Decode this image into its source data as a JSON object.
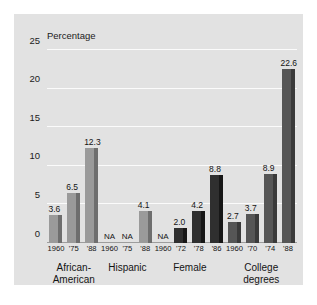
{
  "chart_data": {
    "type": "bar",
    "title": "",
    "xlabel": "",
    "ylabel": "Percentage",
    "ylim": [
      0,
      25
    ],
    "yticks": [
      0,
      5,
      10,
      15,
      20,
      25
    ],
    "ytick_labels": [
      "0",
      "5",
      "10",
      "15",
      "20",
      "25"
    ],
    "grid": true,
    "legend": "none",
    "na_text": "NA",
    "groups": [
      {
        "name": "African-American",
        "label_lines": [
          "African-",
          "American"
        ],
        "color": "#9a9a9a",
        "side_color": "#6e6e6e",
        "bars": [
          {
            "year": "1960",
            "value": 3.6,
            "label": "3.6",
            "na": false
          },
          {
            "year": "'75",
            "value": 6.5,
            "label": "6.5",
            "na": false
          },
          {
            "year": "'88",
            "value": 12.3,
            "label": "12.3",
            "na": false
          }
        ]
      },
      {
        "name": "Hispanic",
        "label_lines": [
          "Hispanic"
        ],
        "color": "#9a9a9a",
        "side_color": "#6e6e6e",
        "bars": [
          {
            "year": "1960",
            "value": null,
            "label": "NA",
            "na": true
          },
          {
            "year": "'75",
            "value": null,
            "label": "NA",
            "na": true
          },
          {
            "year": "'88",
            "value": 4.1,
            "label": "4.1",
            "na": false
          }
        ]
      },
      {
        "name": "Female",
        "label_lines": [
          "Female"
        ],
        "color": "#2f2f2f",
        "side_color": "#171717",
        "bars": [
          {
            "year": "1960",
            "value": null,
            "label": "NA",
            "na": true
          },
          {
            "year": "'72",
            "value": 2.0,
            "label": "2.0",
            "na": false
          },
          {
            "year": "'78",
            "value": 4.2,
            "label": "4.2",
            "na": false
          },
          {
            "year": "'86",
            "value": 8.8,
            "label": "8.8",
            "na": false
          }
        ]
      },
      {
        "name": "College degrees",
        "label_lines": [
          "College",
          "degrees"
        ],
        "color": "#565656",
        "side_color": "#3a3a3a",
        "bars": [
          {
            "year": "1960",
            "value": 2.7,
            "label": "2.7",
            "na": false
          },
          {
            "year": "'70",
            "value": 3.7,
            "label": "3.7",
            "na": false
          },
          {
            "year": "'74",
            "value": 8.9,
            "label": "8.9",
            "na": false
          },
          {
            "year": "'88",
            "value": 22.6,
            "label": "22.6",
            "na": false
          }
        ]
      }
    ]
  },
  "colors": {
    "panel_background": "#e2e2e2",
    "page_background": "#ffffff",
    "gridline": "#fbfbfb",
    "axis": "#9d9d9d",
    "text": "#141414"
  }
}
